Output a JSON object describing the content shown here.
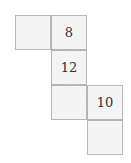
{
  "diagram": {
    "type": "cube-net",
    "faces": [
      {
        "id": "f1",
        "label": ""
      },
      {
        "id": "f2",
        "label": "8"
      },
      {
        "id": "f3",
        "label": "12"
      },
      {
        "id": "f4",
        "label": ""
      },
      {
        "id": "f5",
        "label": "10"
      },
      {
        "id": "f6",
        "label": ""
      }
    ],
    "colors": {
      "face_fill": "#f4f4f4",
      "border": "#b8b8b8",
      "fold_line": "#b0b0b0"
    }
  }
}
